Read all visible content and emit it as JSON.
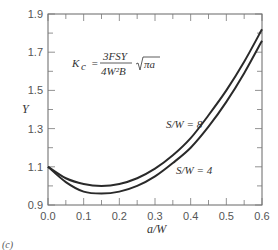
{
  "panel_label": "(c)",
  "formula": {
    "lhs": "K",
    "lhs_sub": "c",
    "equals": "=",
    "numerator": "3FSY",
    "denominator": "4W²B",
    "sqrt_arg": "πa"
  },
  "chart_data": {
    "type": "line",
    "title": "",
    "xlabel": "a/W",
    "ylabel": "Y",
    "xlim": [
      0.0,
      0.6
    ],
    "ylim": [
      0.9,
      1.9
    ],
    "x_ticks": [
      "0.0",
      "0.1",
      "0.2",
      "0.3",
      "0.4",
      "0.5",
      "0.6"
    ],
    "y_ticks": [
      "0.9",
      "1.1",
      "1.3",
      "1.5",
      "1.7",
      "1.9"
    ],
    "grid": false,
    "legend": "inline labels",
    "x": [
      0.0,
      0.05,
      0.1,
      0.15,
      0.2,
      0.25,
      0.3,
      0.35,
      0.4,
      0.45,
      0.5,
      0.55,
      0.6
    ],
    "series": [
      {
        "name": "S/W = 8",
        "values": [
          1.1,
          1.04,
          1.01,
          1.0,
          1.01,
          1.04,
          1.09,
          1.16,
          1.25,
          1.37,
          1.5,
          1.65,
          1.82
        ]
      },
      {
        "name": "S/W = 4",
        "values": [
          1.1,
          1.02,
          0.97,
          0.96,
          0.97,
          1.0,
          1.05,
          1.12,
          1.2,
          1.31,
          1.44,
          1.59,
          1.76
        ]
      }
    ]
  }
}
